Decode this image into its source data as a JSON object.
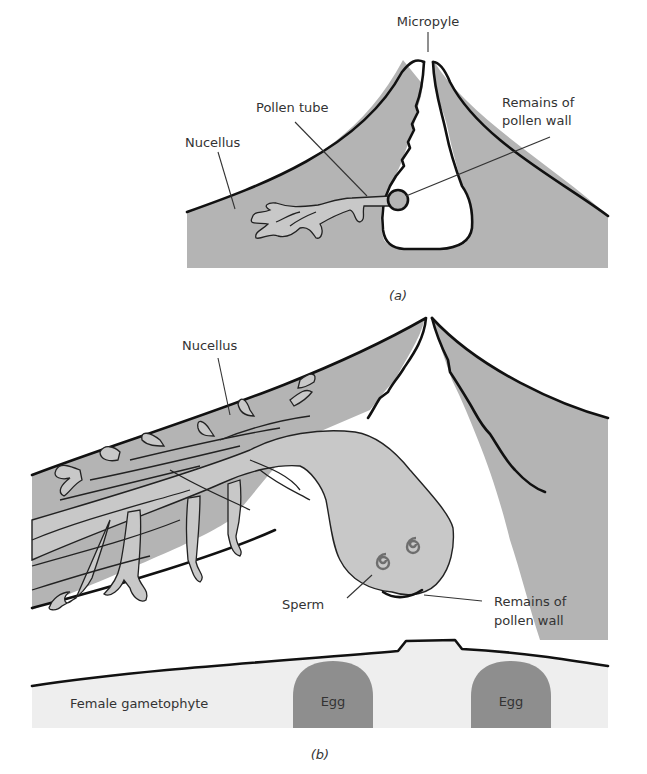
{
  "figure": {
    "panel_a": {
      "caption": "(a)",
      "labels": {
        "micropyle": "Micropyle",
        "pollen_tube": "Pollen tube",
        "nucellus": "Nucellus",
        "remains_line1": "Remains of",
        "remains_line2": "pollen wall"
      }
    },
    "panel_b": {
      "caption": "(b)",
      "labels": {
        "nucellus": "Nucellus",
        "sperm": "Sperm",
        "remains_line1": "Remains of",
        "remains_line2": "pollen wall",
        "female_gametophyte": "Female gametophyte",
        "egg_left": "Egg",
        "egg_right": "Egg"
      }
    },
    "colors": {
      "nucellus_tissue": "#b4b4b4",
      "pollen_tube": "#c8c8c8",
      "gametophyte": "#eeeeee",
      "egg": "#8e8e8e",
      "outline": "#111111",
      "label_text": "#333333"
    }
  }
}
